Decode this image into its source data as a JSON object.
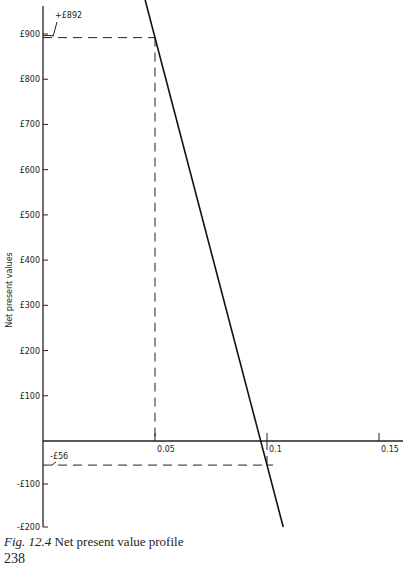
{
  "chart_data": {
    "type": "line",
    "title": "Net present value profile",
    "xlabel": "",
    "ylabel": "Net present values",
    "x_ticks": [
      "0.05",
      "0.1",
      "0.15"
    ],
    "x_tick_values": [
      0.05,
      0.1,
      0.15
    ],
    "y_ticks": [
      "£900",
      "£800",
      "£700",
      "£600",
      "£500",
      "£400",
      "£300",
      "£200",
      "£100",
      "-£100",
      "-£200"
    ],
    "y_tick_values": [
      900,
      800,
      700,
      600,
      500,
      400,
      300,
      200,
      100,
      -100,
      -200
    ],
    "xlim": [
      0,
      0.155
    ],
    "ylim": [
      -200,
      960
    ],
    "grid": false,
    "legend": null,
    "series": [
      {
        "name": "NPV",
        "x": [
          0.05,
          0.1
        ],
        "values": [
          892,
          -56
        ]
      }
    ],
    "annotations": [
      {
        "text": "+£892",
        "x": 0.05,
        "y": 892
      },
      {
        "text": "-£56",
        "x": 0.1,
        "y": -56
      }
    ]
  },
  "caption": {
    "fig_label": "Fig. 12.4",
    "text": " Net present value profile"
  },
  "page_number": "238"
}
